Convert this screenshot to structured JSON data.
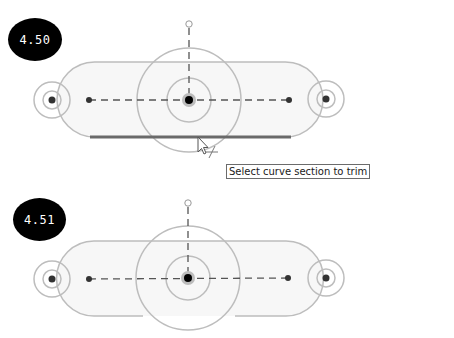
{
  "steps": [
    {
      "badge": "4.50",
      "state": "trim-hover",
      "tooltip": "Select curve section to trim"
    },
    {
      "badge": "4.51",
      "state": "trimmed"
    }
  ],
  "colors": {
    "badge_bg": "#000000",
    "badge_text": "#ffffff",
    "sketch_line": "#b8b8b8",
    "construction_dash": "#555555",
    "highlight_segment": "#6a6a6a",
    "slot_fill": "#f7f7f7"
  }
}
